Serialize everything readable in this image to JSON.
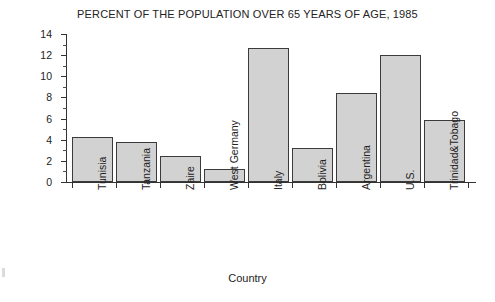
{
  "chart_data": {
    "type": "bar",
    "title": "PERCENT OF THE POPULATION OVER 65 YEARS OF AGE, 1985",
    "xlabel": "Country",
    "ylabel": "Percent",
    "categories": [
      "Tunisia",
      "Tanzania",
      "Zaire",
      "West Germany",
      "Italy",
      "Bolivia",
      "Argentina",
      "U.S.",
      "Trinidad&Tobago"
    ],
    "values": [
      4.3,
      3.8,
      2.5,
      1.2,
      12.7,
      3.2,
      8.4,
      12.0,
      5.9
    ],
    "ylim": [
      0,
      14
    ],
    "ytick_labels": [
      "0",
      "2",
      "4",
      "6",
      "8",
      "10",
      "12",
      "14"
    ],
    "ytick_values": [
      0,
      2,
      4,
      6,
      8,
      10,
      12,
      14
    ],
    "yminor_values": [
      1,
      3,
      5,
      7,
      9,
      11,
      13
    ],
    "grid": false,
    "legend": "none",
    "bar_fill_color": "#d2d2d2",
    "bar_edge_color": "#3b3b3b",
    "axis_color": "#333333",
    "background_color": "#ffffff"
  }
}
